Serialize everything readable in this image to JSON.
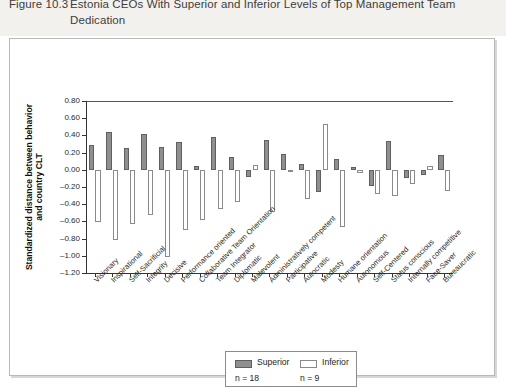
{
  "caption": {
    "figure_number": "Figure 10.3",
    "line1": "Estonia CEOs With Superior and Inferior Levels of Top Management Team",
    "line2": "Dedication"
  },
  "legend": {
    "superior_label": "Superior",
    "inferior_label": "Inferior",
    "superior_n": "n = 18",
    "inferior_n": "n = 9",
    "superior_color": "#8f8f8f",
    "inferior_color": "#ffffff"
  },
  "chart_data": {
    "type": "bar",
    "title": "Estonia CEOs With Superior and Inferior Levels of Top Management Team Dedication",
    "xlabel": "",
    "ylabel": "Standardized distance between behavior and country CLT",
    "ylim": [
      -1.2,
      0.8
    ],
    "yticks": [
      0.8,
      0.6,
      0.4,
      0.2,
      0.0,
      -0.2,
      -0.4,
      -0.6,
      -0.8,
      -1.0,
      -1.2
    ],
    "ytick_labels": [
      "0.80",
      "0.60",
      "0.40",
      "0.20",
      "0.00",
      "–0.20",
      "–0.40",
      "–0.60",
      "–0.80",
      "–1.00",
      "–1.20"
    ],
    "grid": false,
    "legend_position": "bottom-center",
    "categories": [
      "Visionary",
      "Inspirational",
      "Self-Sacrificial",
      "Integrity",
      "Decisive",
      "Performance oriented",
      "Collaborative Team Orientation",
      "Team Integrator",
      "Diplomatic",
      "Malevolent",
      "Administratively competent",
      "Participative",
      "Autocratic",
      "Modesty",
      "Humane orientation",
      "Autonomous",
      "Self-Centered",
      "Status conscious",
      "Internally competitive",
      "Face-Saver",
      "Bureaucratic"
    ],
    "series": [
      {
        "name": "Superior",
        "n": 18,
        "color": "#8f8f8f",
        "values": [
          0.29,
          0.44,
          0.25,
          0.42,
          0.27,
          0.32,
          0.04,
          0.38,
          0.15,
          -0.08,
          0.35,
          0.18,
          0.07,
          -0.26,
          0.12,
          0.03,
          -0.19,
          0.33,
          -0.1,
          -0.06,
          0.17
        ]
      },
      {
        "name": "Inferior",
        "n": 9,
        "color": "#ffffff",
        "values": [
          -0.61,
          -0.82,
          -0.63,
          -0.53,
          -1.01,
          -0.7,
          -0.58,
          -0.46,
          -0.37,
          0.06,
          -0.49,
          -0.03,
          -0.34,
          0.53,
          -0.66,
          -0.04,
          -0.28,
          -0.3,
          -0.17,
          0.04,
          -0.25
        ]
      }
    ]
  }
}
